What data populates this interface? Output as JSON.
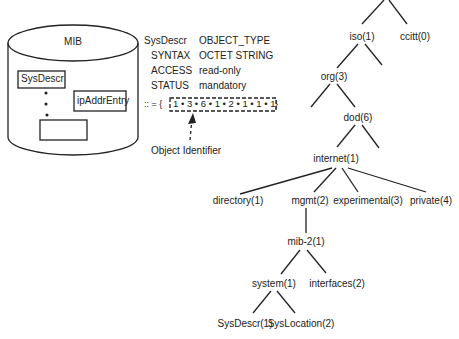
{
  "mib": {
    "title": "MIB",
    "entries": [
      "SysDescr",
      "ipAddrEntry",
      ""
    ]
  },
  "definition": {
    "name": "SysDescr",
    "type": "OBJECT_TYPE",
    "rows": [
      {
        "key": "SYNTAX",
        "value": "OCTET STRING"
      },
      {
        "key": "ACCESS",
        "value": "read-only"
      },
      {
        "key": "STATUS",
        "value": "mandatory"
      }
    ],
    "assign_prefix": ":: = {",
    "oid": "1 • 3 • 6 • 1 • 2 • 1 • 1 • 1",
    "assign_suffix": "}",
    "oid_caption": "Object Identifier"
  },
  "tree": {
    "iso": "iso(1)",
    "ccitt": "ccitt(0)",
    "org": "org(3)",
    "dod": "dod(6)",
    "internet": "internet(1)",
    "directory": "directory(1)",
    "mgmt": "mgmt(2)",
    "experimental": "experimental(3)",
    "private": "private(4)",
    "mib2": "mib-2(1)",
    "system": "system(1)",
    "interfaces": "interfaces(2)",
    "sysdescr": "SysDescr(1)",
    "syslocation": "SysLocation(2)"
  }
}
